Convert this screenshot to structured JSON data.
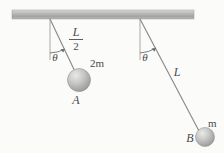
{
  "figure": {
    "background_color": "#fbfbfa",
    "ceiling": {
      "name": "ceiling-bar",
      "x": 12,
      "y": 10,
      "width": 182,
      "height": 9,
      "color_top": "#d8d8d6",
      "color_mid": "#a9a9a7",
      "color_bottom": "#bdbdbb"
    },
    "string_color": "#8a8a8a",
    "label_color": "#4a4a4a",
    "sphere_color_light": "#e2e2e0",
    "sphere_color_mid": "#bdbdbb",
    "sphere_color_dark": "#9b9b99"
  },
  "pendulum_left": {
    "name": "pendulum-a",
    "pivot": {
      "x": 50,
      "y": 19
    },
    "bob": {
      "x": 79,
      "y": 80,
      "radius": 11.5
    },
    "angle_deg": 25,
    "length_label_numerator": "L",
    "length_label_denominator": "2",
    "length_label_pos": {
      "x": 76,
      "y": 37
    },
    "angle_label": "θ",
    "angle_label_pos": {
      "x": 55,
      "y": 57
    },
    "mass_label": "2m",
    "mass_label_pos": {
      "x": 90,
      "y": 68
    },
    "bob_label": "A",
    "bob_label_pos": {
      "x": 75,
      "y": 103
    }
  },
  "pendulum_right": {
    "name": "pendulum-b",
    "pivot": {
      "x": 140,
      "y": 19
    },
    "bob": {
      "x": 205,
      "y": 137,
      "radius": 9.5
    },
    "angle_deg": 28,
    "length_label": "L",
    "length_label_pos": {
      "x": 177,
      "y": 75
    },
    "angle_label": "θ",
    "angle_label_pos": {
      "x": 145,
      "y": 57
    },
    "mass_label": "m",
    "mass_label_pos": {
      "x": 209,
      "y": 126
    },
    "bob_label": "B",
    "bob_label_pos": {
      "x": 190,
      "y": 141
    }
  }
}
